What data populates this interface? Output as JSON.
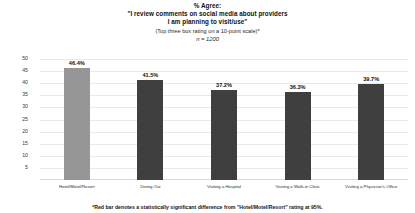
{
  "chart_data": {
    "type": "bar",
    "title": "% Agree:",
    "title_lines": [
      "% Agree:",
      "\"I review comments on social media about providers",
      "I am planning to visit/use\""
    ],
    "subtitle": "(Top three box rating on a 10-point scale)*",
    "sample_size": "n = 1200",
    "categories": [
      "Hotel/Motel/Resort",
      "Dining Out",
      "Visiting a Hospital",
      "Visiting a Walk-in Clinic",
      "Visiting a Physician's Office"
    ],
    "values": [
      46.4,
      41.5,
      37.2,
      36.3,
      39.7
    ],
    "value_labels": [
      "46.4%",
      "41.5%",
      "37.2%",
      "36.3%",
      "39.7%"
    ],
    "bar_colors": [
      "#969696",
      "#3f3f3f",
      "#3f3f3f",
      "#3f3f3f",
      "#3f3f3f"
    ],
    "highlight_index": 0,
    "xlabel": "",
    "ylabel": "",
    "ylim": [
      0,
      50
    ],
    "yticks": [
      50,
      45,
      40,
      35,
      30,
      25,
      20,
      15,
      10,
      5
    ],
    "ytick_labels": [
      "50",
      "45",
      "40",
      "35",
      "30",
      "25",
      "20",
      "15",
      "10",
      "5"
    ],
    "grid": true,
    "legend": "none",
    "footnote": "*Red bar denotes a statistically significant difference from \"Hotel/Motel/Resort\" rating at 95%."
  }
}
